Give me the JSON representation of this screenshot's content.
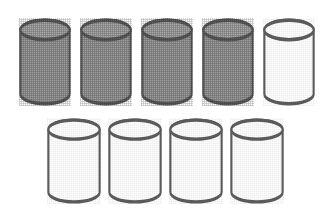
{
  "figure": {
    "background_color": "#ffffff",
    "width": 333,
    "height": 218,
    "style": {
      "outline_color": "#5d5d5d",
      "outline_highlight_color": "#8d8d8d",
      "fill_shaded": "#9c9c9c",
      "fill_shaded_top": "#a8a8a8",
      "fill_empty": "#ffffff",
      "stroke_width": 2.1
    },
    "counts": {
      "total_label": "9",
      "shaded_label": "4",
      "unshaded_label": "5",
      "top_row_label": "5",
      "bottom_row_label": "4"
    },
    "rows": [
      {
        "name": "top-row",
        "cylinders": [
          {
            "name": "cylinder-1",
            "shaded": true,
            "x": 19,
            "y": 18,
            "w": 52,
            "h": 88
          },
          {
            "name": "cylinder-2",
            "shaded": true,
            "x": 80,
            "y": 18,
            "w": 52,
            "h": 88
          },
          {
            "name": "cylinder-3",
            "shaded": true,
            "x": 141,
            "y": 18,
            "w": 52,
            "h": 88
          },
          {
            "name": "cylinder-4",
            "shaded": true,
            "x": 202,
            "y": 18,
            "w": 52,
            "h": 88
          },
          {
            "name": "cylinder-5",
            "shaded": false,
            "x": 263,
            "y": 18,
            "w": 52,
            "h": 88
          }
        ]
      },
      {
        "name": "bottom-row",
        "cylinders": [
          {
            "name": "cylinder-6",
            "shaded": false,
            "x": 47,
            "y": 118,
            "w": 54,
            "h": 86
          },
          {
            "name": "cylinder-7",
            "shaded": false,
            "x": 108,
            "y": 118,
            "w": 54,
            "h": 86
          },
          {
            "name": "cylinder-8",
            "shaded": false,
            "x": 169,
            "y": 118,
            "w": 54,
            "h": 86
          },
          {
            "name": "cylinder-9",
            "shaded": false,
            "x": 230,
            "y": 118,
            "w": 54,
            "h": 86
          }
        ]
      }
    ]
  }
}
